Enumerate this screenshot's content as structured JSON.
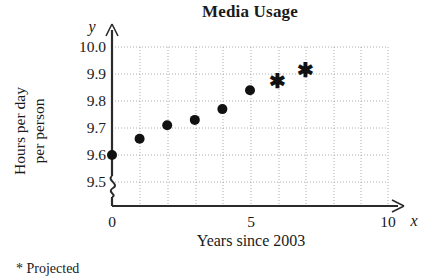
{
  "chart_data": {
    "type": "scatter",
    "title": "Media Usage",
    "xlabel": "Years since 2003",
    "ylabel_line1": "Hours per day",
    "ylabel_line2": "per person",
    "x_axis_variable": "x",
    "y_axis_variable": "y",
    "xlim": [
      0,
      10
    ],
    "ylim": [
      9.5,
      10.0
    ],
    "y_axis_break": true,
    "grid": true,
    "grid_style": "dotted",
    "legend": "none",
    "footnote": "* Projected",
    "x_tick_labels": [
      "0",
      "5",
      "10"
    ],
    "x_tick_values": [
      0,
      5,
      10
    ],
    "y_tick_labels": [
      "9.5",
      "9.6",
      "9.7",
      "9.8",
      "9.9",
      "10.0"
    ],
    "y_tick_values": [
      9.5,
      9.6,
      9.7,
      9.8,
      9.9,
      10.0
    ],
    "x_minor_step": 1,
    "y_minor_step": 0.1,
    "series": [
      {
        "name": "Actual",
        "marker": "filled-circle",
        "color": "#111111",
        "x": [
          0,
          1,
          2,
          3,
          4,
          5
        ],
        "values": [
          9.6,
          9.66,
          9.71,
          9.73,
          9.77,
          9.84
        ]
      },
      {
        "name": "Projected",
        "marker": "asterisk",
        "color": "#111111",
        "x": [
          6,
          7
        ],
        "values": [
          9.87,
          9.91
        ]
      }
    ]
  },
  "icons": {
    "y_axis_arrow": "arrow-up-icon",
    "x_axis_arrow": "arrow-right-icon",
    "axis_break": "axis-break-squiggle-icon"
  }
}
